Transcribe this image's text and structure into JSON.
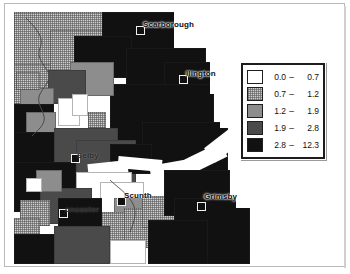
{
  "figure": {
    "map_area_label": "map-canvas"
  },
  "places": [
    {
      "name": "Scarborough",
      "x": 129,
      "y": 8,
      "marker_x": 122,
      "marker_y": 14,
      "tone": "normal"
    },
    {
      "name": "llington",
      "x": 172,
      "y": 57,
      "marker_x": 165,
      "marker_y": 63,
      "tone": "normal"
    },
    {
      "name": "Selby",
      "x": 63,
      "y": 139,
      "marker_x": 57,
      "marker_y": 142,
      "tone": "dim"
    },
    {
      "name": "Scunth",
      "x": 110,
      "y": 179,
      "marker_x": 103,
      "marker_y": 185,
      "tone": "onwhite"
    },
    {
      "name": "Grimsby",
      "x": 190,
      "y": 180,
      "marker_x": 183,
      "marker_y": 190,
      "tone": "normal"
    },
    {
      "name": "oncaster",
      "x": 51,
      "y": 193,
      "marker_x": 45,
      "marker_y": 197,
      "tone": "dim"
    }
  ],
  "legend": {
    "name": "map-legend",
    "classes": [
      {
        "swatch": "c1",
        "low": "0.0",
        "dash": "–",
        "high": "0.7",
        "color": "#ffffff"
      },
      {
        "swatch": "c2",
        "low": "0.7",
        "dash": "–",
        "high": "1.2",
        "color": "#cfcfcf"
      },
      {
        "swatch": "c3",
        "low": "1.2",
        "dash": "–",
        "high": "1.9",
        "color": "#8d8d8d"
      },
      {
        "swatch": "c4",
        "low": "1.9",
        "dash": "–",
        "high": "2.8",
        "color": "#4a4a4a"
      },
      {
        "swatch": "c5",
        "low": "2.8",
        "dash": "–",
        "high": "12.3",
        "color": "#111111"
      }
    ]
  },
  "chart_data": {
    "type": "heatmap",
    "classification": "graduated, 5 classes",
    "class_breaks": [
      0.0,
      0.7,
      1.2,
      1.9,
      2.8,
      12.3
    ],
    "class_labels": [
      "0.0 – 0.7",
      "0.7 – 1.2",
      "1.2 – 1.9",
      "1.9 – 2.8",
      "2.8 – 12.3"
    ],
    "class_colors": [
      "#ffffff",
      "#cfcfcf",
      "#8d8d8d",
      "#4a4a4a",
      "#111111"
    ],
    "legend_position": "upper-right",
    "annotations": [
      "Scarborough",
      "llington",
      "Selby",
      "Scunth",
      "Grimsby",
      "oncaster"
    ],
    "grid": false,
    "xlabel": "",
    "ylabel": ""
  }
}
